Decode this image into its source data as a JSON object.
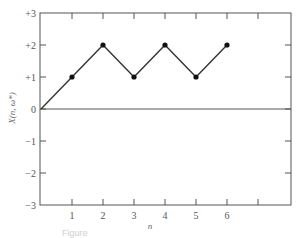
{
  "chart_data": {
    "type": "line",
    "title": "",
    "xlabel": "n",
    "ylabel": "X(n, ω*)",
    "x": [
      0,
      1,
      2,
      3,
      4,
      5,
      6
    ],
    "series": [
      {
        "name": "X(n, ω*)",
        "values": [
          0,
          1,
          2,
          1,
          2,
          1,
          2
        ],
        "markers": [
          false,
          true,
          true,
          true,
          true,
          true,
          true
        ]
      }
    ],
    "xlim": [
      0,
      8
    ],
    "ylim": [
      -3,
      3
    ],
    "x_ticks": [
      1,
      2,
      3,
      4,
      5,
      6,
      7
    ],
    "x_tick_labels": [
      "1",
      "2",
      "3",
      "4",
      "5",
      "6",
      ""
    ],
    "y_ticks": [
      -3,
      -2,
      -1,
      0,
      1,
      2,
      3
    ],
    "y_tick_labels": [
      "−3",
      "−2",
      "−1",
      "0",
      "+1",
      "+2",
      "+3"
    ],
    "zero_line": true,
    "grid": false,
    "legend": "none",
    "colors": {
      "line": "#333333",
      "axis": "#555555",
      "marker": "#111111"
    }
  },
  "caption": "Figure"
}
